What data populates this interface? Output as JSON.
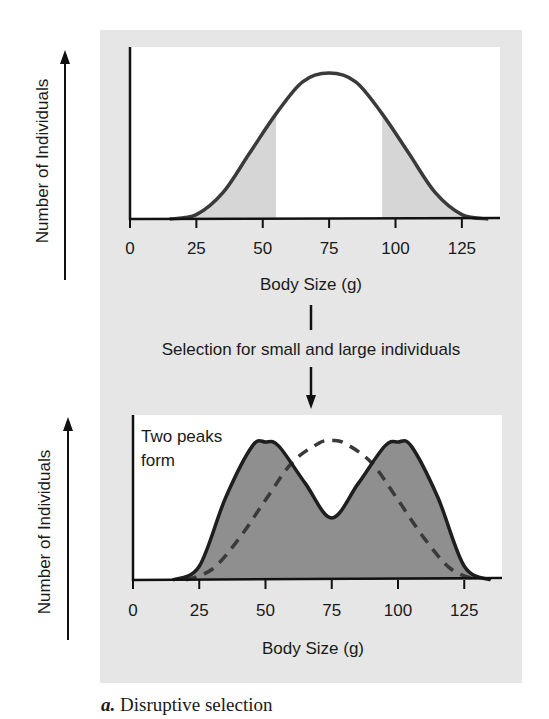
{
  "figure": {
    "caption_letter": "a.",
    "caption_text": " Disruptive selection",
    "transition_label": "Selection for small and large individuals",
    "colors": {
      "panel_bg": "#e6e6e6",
      "plot_bg": "#ffffff",
      "curve_stroke": "#3a3a3a",
      "light_fill": "#d6d6d6",
      "dark_fill": "#8f8f8f",
      "axis": "#111111"
    }
  },
  "chart_data": [
    {
      "type": "area",
      "title": "",
      "xlabel": "Body Size (g)",
      "ylabel": "Number of Individuals",
      "xticks": [
        0,
        25,
        50,
        75,
        100,
        125
      ],
      "xlim": [
        0,
        140
      ],
      "grid": false,
      "description": "Unimodal bell-shaped distribution centered at 75 g; tails (below ~55 g and above ~95 g) shaded light gray, central region white",
      "shaded_ranges": [
        [
          20,
          55
        ],
        [
          95,
          130
        ]
      ],
      "series": [
        {
          "name": "Original population",
          "style": "solid",
          "x": [
            15,
            25,
            35,
            45,
            55,
            65,
            75,
            85,
            95,
            105,
            115,
            125,
            135
          ],
          "y": [
            0,
            3,
            18,
            45,
            72,
            94,
            100,
            94,
            72,
            45,
            18,
            3,
            0
          ]
        }
      ]
    },
    {
      "type": "area",
      "title": "",
      "xlabel": "Body Size (g)",
      "ylabel": "Number of Individuals",
      "xticks": [
        0,
        25,
        50,
        75,
        100,
        125
      ],
      "xlim": [
        0,
        140
      ],
      "grid": false,
      "annotation": "Two peaks form",
      "series": [
        {
          "name": "After disruptive selection",
          "style": "solid-filled-dark",
          "x": [
            15,
            25,
            35,
            45,
            50,
            55,
            65,
            75,
            85,
            95,
            100,
            105,
            115,
            125,
            135
          ],
          "y": [
            0,
            10,
            60,
            97,
            100,
            97,
            70,
            45,
            70,
            97,
            100,
            97,
            60,
            10,
            0
          ]
        },
        {
          "name": "Original distribution",
          "style": "dashed",
          "x": [
            20,
            30,
            40,
            50,
            60,
            70,
            75,
            80,
            90,
            100,
            110,
            120,
            130
          ],
          "y": [
            0,
            8,
            30,
            58,
            85,
            99,
            101,
            99,
            85,
            58,
            30,
            8,
            0
          ]
        }
      ]
    }
  ]
}
